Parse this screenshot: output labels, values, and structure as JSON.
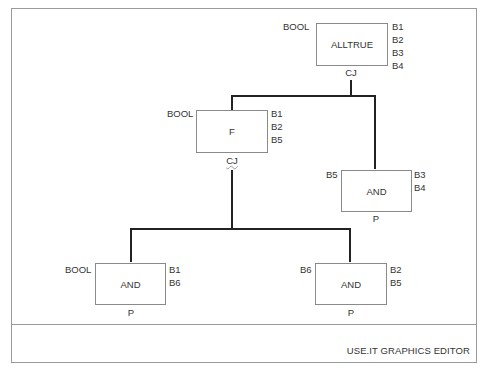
{
  "app": {
    "status_bar": "USE.IT GRAPHICS EDITOR"
  },
  "diagram": {
    "nodes": {
      "alltrue": {
        "label": "ALLTRUE",
        "left_inputs": "BOOL",
        "right_inputs": [
          "B1",
          "B2",
          "B3",
          "B4"
        ],
        "bottom_port": "CJ"
      },
      "f": {
        "label": "F",
        "left_inputs": "BOOL",
        "right_inputs": [
          "B1",
          "B2",
          "B5"
        ],
        "bottom_port": "CJ"
      },
      "and_right": {
        "label": "AND",
        "left_inputs": "B5",
        "right_inputs": [
          "B3",
          "B4"
        ],
        "bottom_port": "P"
      },
      "and_left": {
        "label": "AND",
        "left_inputs": "BOOL",
        "right_inputs": [
          "B1",
          "B6"
        ],
        "bottom_port": "P"
      },
      "and_bottom_right": {
        "label": "AND",
        "left_inputs": "B6",
        "right_inputs": [
          "B2",
          "B5"
        ],
        "bottom_port": "P"
      }
    },
    "edges": [
      {
        "from": "alltrue",
        "to": "f"
      },
      {
        "from": "alltrue",
        "to": "and_right"
      },
      {
        "from": "f",
        "to": "and_left"
      },
      {
        "from": "f",
        "to": "and_bottom_right"
      }
    ]
  }
}
